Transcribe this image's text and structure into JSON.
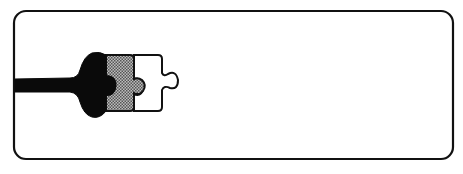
{
  "illustration": {
    "subject": "puzzle-piece-chain",
    "description": "Rounded rectangle frame containing a black stalk-and-bulb piece joined to a hatched gray puzzle piece and a white puzzle piece",
    "colors": {
      "background": "#ffffff",
      "stroke": "#111111",
      "black_piece": "#0a0a0a",
      "gray_piece": "#8a8a8a",
      "white_piece": "#ffffff"
    },
    "pieces": [
      {
        "name": "black-stalk-piece",
        "fill": "black"
      },
      {
        "name": "gray-puzzle-piece",
        "fill": "hatched-gray"
      },
      {
        "name": "white-puzzle-piece",
        "fill": "white"
      }
    ]
  }
}
